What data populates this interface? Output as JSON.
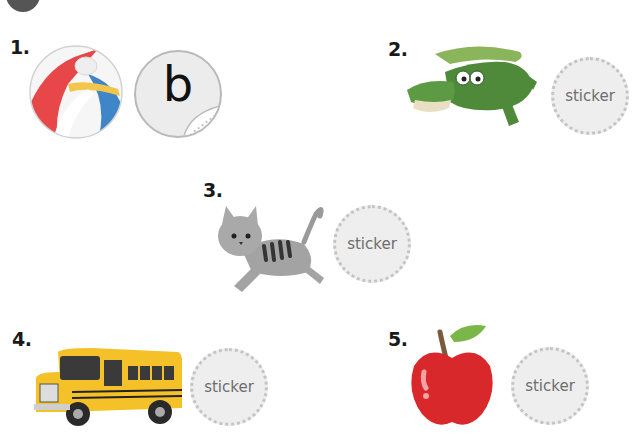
{
  "header": {
    "badge_shape": "circle"
  },
  "items": [
    {
      "number": "1.",
      "picture": "beach-ball",
      "sticker_label": "b",
      "sticker_state": "placed"
    },
    {
      "number": "2.",
      "picture": "crocodile",
      "sticker_label": "sticker",
      "sticker_state": "empty"
    },
    {
      "number": "3.",
      "picture": "cat",
      "sticker_label": "sticker",
      "sticker_state": "empty"
    },
    {
      "number": "4.",
      "picture": "bus",
      "sticker_label": "sticker",
      "sticker_state": "empty"
    },
    {
      "number": "5.",
      "picture": "apple",
      "sticker_label": "sticker",
      "sticker_state": "empty"
    }
  ],
  "colors": {
    "sticker_fill": "#eeeeee",
    "sticker_border": "#c4c4c4",
    "sticker_text": "#6d6d6d",
    "number_text": "#1a1a1a"
  }
}
